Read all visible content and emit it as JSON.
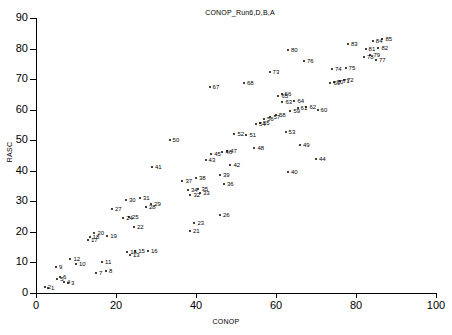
{
  "chart_data": {
    "type": "scatter",
    "title": "CONOP_Run6,D,B,A",
    "xlabel": "CONOP",
    "ylabel": "RASC",
    "xlim": [
      0,
      100
    ],
    "ylim": [
      0,
      90
    ],
    "xticks": [
      0,
      20,
      40,
      60,
      80,
      100
    ],
    "yticks": [
      0,
      10,
      20,
      30,
      40,
      50,
      60,
      70,
      80,
      90
    ],
    "grid": false,
    "legend": null,
    "point_color": "#000000",
    "series": [
      {
        "name": "events",
        "labels": [
          "1",
          "2",
          "3",
          "4",
          "5",
          "6",
          "7",
          "8",
          "9",
          "10",
          "11",
          "12",
          "13",
          "14",
          "15",
          "16",
          "17",
          "18",
          "19",
          "20",
          "21",
          "22",
          "23",
          "24",
          "25",
          "26",
          "27",
          "28",
          "29",
          "30",
          "31",
          "32",
          "33",
          "34",
          "35",
          "36",
          "37",
          "38",
          "39",
          "40",
          "41",
          "42",
          "43",
          "44",
          "45",
          "46",
          "47",
          "48",
          "49",
          "50",
          "51",
          "52",
          "53",
          "54",
          "55",
          "56",
          "57",
          "58",
          "59",
          "60",
          "61",
          "62",
          "63",
          "64",
          "65",
          "66",
          "67",
          "68",
          "69",
          "70",
          "71",
          "72",
          "73",
          "74",
          "75",
          "76",
          "77",
          "78",
          "79",
          "80",
          "81",
          "82",
          "83",
          "84",
          "85"
        ],
        "points": [
          [
            3.0,
            1.6
          ],
          [
            2.2,
            2.0
          ],
          [
            8.0,
            3.2
          ],
          [
            7.0,
            3.6
          ],
          [
            5.3,
            4.6
          ],
          [
            6.0,
            5.4
          ],
          [
            15.0,
            6.4
          ],
          [
            17.5,
            7.2
          ],
          [
            5.0,
            8.6
          ],
          [
            10.0,
            9.4
          ],
          [
            16.5,
            10.2
          ],
          [
            8.6,
            11.2
          ],
          [
            23.5,
            12.4
          ],
          [
            22.8,
            13.4
          ],
          [
            24.8,
            13.8
          ],
          [
            28.0,
            13.6
          ],
          [
            13.0,
            17.4
          ],
          [
            13.4,
            18.4
          ],
          [
            17.8,
            18.6
          ],
          [
            14.6,
            19.6
          ],
          [
            38.5,
            20.4
          ],
          [
            24.5,
            21.6
          ],
          [
            39.6,
            23.0
          ],
          [
            21.8,
            24.4
          ],
          [
            23.2,
            25.0
          ],
          [
            46.0,
            25.6
          ],
          [
            19.0,
            27.6
          ],
          [
            27.5,
            28.0
          ],
          [
            28.8,
            29.0
          ],
          [
            22.5,
            30.6
          ],
          [
            26.0,
            31.0
          ],
          [
            38.6,
            32.2
          ],
          [
            41.0,
            32.6
          ],
          [
            38.0,
            33.8
          ],
          [
            40.6,
            34.2
          ],
          [
            47.0,
            35.6
          ],
          [
            36.6,
            36.8
          ],
          [
            40.0,
            37.8
          ],
          [
            46.0,
            38.6
          ],
          [
            63.0,
            39.6
          ],
          [
            29.0,
            41.4
          ],
          [
            48.6,
            41.8
          ],
          [
            42.4,
            43.4
          ],
          [
            70.0,
            43.8
          ],
          [
            43.8,
            45.4
          ],
          [
            46.6,
            46.2
          ],
          [
            47.8,
            46.6
          ],
          [
            54.6,
            47.6
          ],
          [
            66.0,
            48.4
          ],
          [
            33.4,
            50.0
          ],
          [
            52.6,
            51.6
          ],
          [
            49.6,
            52.2
          ],
          [
            62.4,
            52.8
          ],
          [
            55.0,
            55.4
          ],
          [
            56.0,
            55.6
          ],
          [
            57.0,
            57.0
          ],
          [
            58.6,
            57.6
          ],
          [
            60.0,
            58.2
          ],
          [
            63.6,
            59.6
          ],
          [
            70.4,
            59.8
          ],
          [
            65.4,
            60.6
          ],
          [
            67.6,
            61.0
          ],
          [
            61.6,
            62.4
          ],
          [
            64.6,
            63.0
          ],
          [
            60.6,
            64.4
          ],
          [
            61.4,
            65.0
          ],
          [
            43.4,
            67.4
          ],
          [
            52.0,
            68.6
          ],
          [
            73.6,
            68.8
          ],
          [
            74.4,
            69.2
          ],
          [
            76.0,
            69.4
          ],
          [
            77.0,
            69.8
          ],
          [
            58.4,
            72.4
          ],
          [
            74.0,
            73.4
          ],
          [
            77.4,
            73.6
          ],
          [
            67.0,
            76.0
          ],
          [
            85.0,
            76.4
          ],
          [
            82.0,
            77.4
          ],
          [
            83.6,
            78.0
          ],
          [
            63.0,
            79.6
          ],
          [
            82.4,
            80.0
          ],
          [
            85.6,
            80.2
          ],
          [
            78.0,
            81.6
          ],
          [
            84.2,
            82.6
          ],
          [
            86.6,
            83.0
          ]
        ]
      }
    ]
  }
}
